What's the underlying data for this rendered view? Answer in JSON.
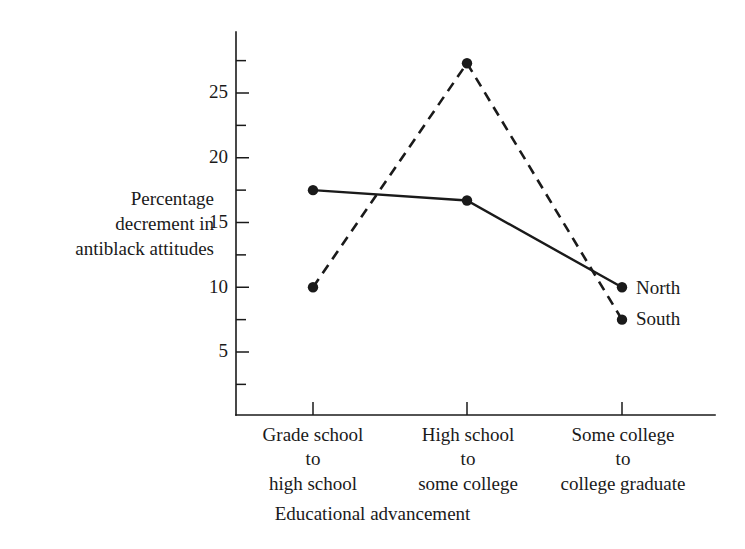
{
  "chart_data": {
    "type": "line",
    "title": "",
    "xlabel": "Educational advancement",
    "ylabel": "Percentage decrement in antiblack attitudes",
    "categories": [
      "Grade school\nto\nhigh school",
      "High school\nto\nsome college",
      "Some college\nto\ncollege graduate"
    ],
    "category_lines": [
      [
        "Grade school",
        "to",
        "high school"
      ],
      [
        "High school",
        "to",
        "some college"
      ],
      [
        "Some college",
        "to",
        "college graduate"
      ]
    ],
    "series": [
      {
        "name": "North",
        "style": "solid",
        "values": [
          17.5,
          16.7,
          10.0
        ]
      },
      {
        "name": "South",
        "style": "dashed",
        "values": [
          10.0,
          27.3,
          7.5
        ]
      }
    ],
    "ylim": [
      0,
      28.5
    ],
    "y_major_ticks": [
      5,
      10,
      15,
      20,
      25
    ],
    "y_minor_ticks": [
      2.5,
      7.5,
      12.5,
      17.5,
      22.5,
      27.5
    ],
    "y_tick_labels": [
      "5",
      "10",
      "15",
      "20",
      "25"
    ],
    "grid": false,
    "legend_position": "right-of-last-point",
    "colors": {
      "ink": "#1a1a1a",
      "background": "#ffffff"
    }
  },
  "axis": {
    "y_title_lines": [
      "Percentage",
      "decrement in",
      "antiblack attitudes"
    ],
    "x_title": "Educational advancement"
  },
  "legend": {
    "north_label": "North",
    "south_label": "South"
  }
}
